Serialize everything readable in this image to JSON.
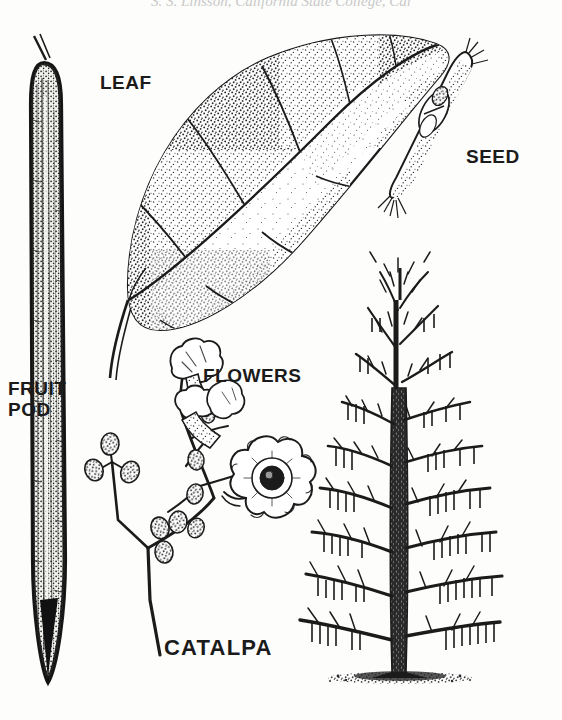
{
  "plate": {
    "title": "CATALPA",
    "background_color": "#fdfdfb",
    "ink_color": "#1b1b1b",
    "header_credit": "S. S. Linsson, California State College, Cal",
    "labels": [
      {
        "key": "leaf",
        "text": "LEAF"
      },
      {
        "key": "seed",
        "text": "SEED"
      },
      {
        "key": "fruit_pod",
        "text": "FRUIT\nPOD"
      },
      {
        "key": "flowers",
        "text": "FLOWERS"
      },
      {
        "key": "catalpa",
        "text": "CATALPA"
      }
    ],
    "figures": [
      {
        "name": "fruit-pod-figure",
        "label": "FRUIT POD",
        "description": "Long slender vertical bean-like seed pod, stippled, tapering to a point"
      },
      {
        "name": "leaf-figure",
        "label": "LEAF",
        "description": "Large heart-shaped stippled leaf with midrib, lateral veins and curving petiole"
      },
      {
        "name": "seed-figure",
        "label": "SEED",
        "description": "Narrow winged seed with fringed tips, drawn diagonally"
      },
      {
        "name": "flowers-figure",
        "label": "FLOWERS",
        "description": "Branching panicle of buds and frilly trumpet-shaped blossoms"
      },
      {
        "name": "tree-figure",
        "label": "CATALPA",
        "description": "Bare winter tree silhouette with dark trunk, spreading branches and hanging pods"
      }
    ]
  }
}
